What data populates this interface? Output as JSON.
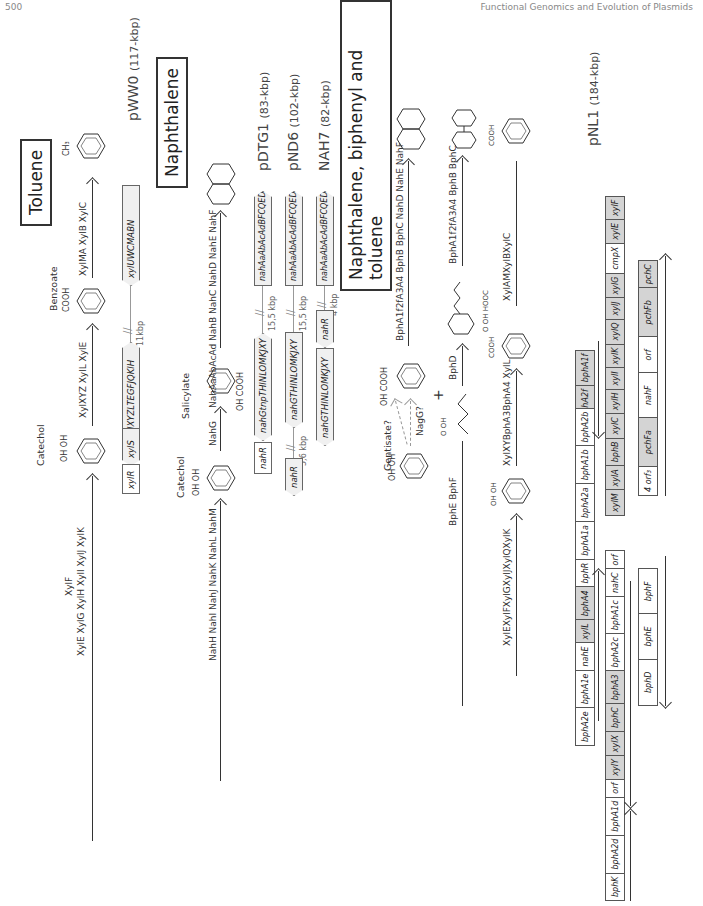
{
  "page_header": {
    "left": "500",
    "right": "Functional Genomics and Evolution of Plasmids"
  },
  "sections": {
    "toluene": "Toluene",
    "naphthalene": "Naphthalene",
    "nbt": "Naphthalene, biphenyl and toluene"
  },
  "toluene": {
    "substrate": "CH₃",
    "step1_enzymes": "XylMA XylB XylC",
    "benzoate_label": "Benzoate",
    "benzoate_group": "COOH",
    "step2_enzymes": "XylXYZ XylL XylE",
    "catechol_label": "Catechol",
    "catechol_groups": [
      "OH",
      "OH"
    ],
    "step3_enzymes_top": "XylF",
    "step3_enzymes": "XylE XylG XylH XylI XylJ XylK",
    "plasmid": {
      "name": "pWW0",
      "size": "(117-kbp)"
    },
    "genes": {
      "upper": "xylUWCMABN",
      "gap": "11kbp",
      "lower": "xylXYZLTEGFJQKIH",
      "s": "xylS",
      "r": "xylR"
    }
  },
  "naphthalene": {
    "step1_enzymes": "NahAaAbAcAd NahB NahC NahD NahE NahF",
    "salicylate_label": "Salicylate",
    "salicylate_groups": [
      "OH",
      "COOH"
    ],
    "step2_enzyme": "NahG",
    "catechol_label": "Catechol",
    "catechol_groups": [
      "OH",
      "OH"
    ],
    "step3_enzymes": "NahH NahI NahJ NahK NahL NahM",
    "plasmids": [
      {
        "name": "pDTG1",
        "size": "(83-kbp)",
        "upper": "nahAaAbAcAdBFCQED",
        "gap": "15,5 kbp",
        "lower": "nahGtnpTHINLOMKJXY",
        "extra": "nahR"
      },
      {
        "name": "pND6",
        "size": "(102-kbp)",
        "upper": "nahAaAbAcAdBFCQED",
        "gap": "15,5 kbp",
        "lower": "nahGTHINLOMKJXY",
        "gap2": "5,6 kbp",
        "extra": "nahR"
      },
      {
        "name": "NAH7",
        "size": "(82-kbp)",
        "upper": "nahAaAbAcAdBFCQED",
        "gap": "4 kbp",
        "mid": "nahR",
        "lower": "nahGTHINLOMKJXY"
      }
    ]
  },
  "nbt": {
    "naph_enzymes": "BphA1f2fA3A4 BphB BphC NahD NahE NahF",
    "salicylate_groups": [
      "OH",
      "COOH"
    ],
    "gentisate": "Gentisate?",
    "nagg": "NagG?",
    "catechol_groups": [
      "OH",
      "OH"
    ],
    "biph_enzymes": "BphA1f2fA3A4 BphB BphC",
    "hopda_groups": [
      "O",
      "OH",
      "HOOC"
    ],
    "bphd": "BphD",
    "plus": "+",
    "pentadienoate_groups": [
      "O",
      "OH"
    ],
    "bphef": "BphE BphF",
    "benz_group": "COOH",
    "xyl_enzymes": "XylAMXylBXylC",
    "benz2_group": "COOH",
    "xyl2_enzymes": "XylXYBphA3BphA4 XylL",
    "cat_groups": [
      "OH",
      "OH"
    ],
    "xyl3_enzymes": "XylEXylFXylGXylJXylQXylK",
    "plasmid": {
      "name": "pNL1",
      "size": "(184-kbp)"
    },
    "row1": [
      {
        "label": "xylB",
        "grey": false
      },
      {
        "label": "bphA2f",
        "grey": true
      },
      {
        "label": "bphA1f",
        "grey": true
      },
      {
        "spacer": true
      },
      {
        "label": "bphA2e",
        "grey": false
      },
      {
        "label": "bphA1e",
        "grey": false
      },
      {
        "label": "nahE",
        "grey": false
      },
      {
        "label": "xylL",
        "grey": true
      },
      {
        "label": "bphA4",
        "grey": true
      },
      {
        "label": "bphR",
        "grey": false
      },
      {
        "label": "bphA1a",
        "grey": false
      },
      {
        "label": "bphA2a",
        "grey": false
      },
      {
        "label": "bphA1b",
        "grey": false
      },
      {
        "label": "bphA2b",
        "grey": false
      }
    ],
    "row2": [
      {
        "label": "xylM",
        "grey": true
      },
      {
        "label": "xylA",
        "grey": true
      },
      {
        "label": "bphB",
        "grey": true
      },
      {
        "label": "xylC",
        "grey": true
      },
      {
        "label": "xylH",
        "grey": true
      },
      {
        "label": "xylI",
        "grey": true
      },
      {
        "label": "xylK",
        "grey": true
      },
      {
        "label": "xylQ",
        "grey": true
      },
      {
        "label": "xylJ",
        "grey": true
      },
      {
        "label": "xylG",
        "grey": true
      },
      {
        "label": "cmpX",
        "grey": false
      },
      {
        "label": "xylE",
        "grey": true
      },
      {
        "label": "xylF",
        "grey": true
      },
      {
        "spacer": true
      },
      {
        "label": "bphK",
        "grey": false
      },
      {
        "label": "bphA2d",
        "grey": false
      },
      {
        "label": "bphA1d",
        "grey": false
      },
      {
        "label": "orf",
        "grey": false
      },
      {
        "label": "xylY",
        "grey": true
      },
      {
        "label": "xylX",
        "grey": true
      },
      {
        "label": "bphC",
        "grey": true
      },
      {
        "label": "bphA3",
        "grey": true
      },
      {
        "label": "bphA2c",
        "grey": false
      },
      {
        "label": "bphA1c",
        "grey": false
      },
      {
        "label": "nahC",
        "grey": false
      },
      {
        "label": "orf",
        "grey": false
      }
    ],
    "row3": [
      {
        "label": "4 orf₃",
        "grey": false
      },
      {
        "label": "pchFa",
        "grey": true
      },
      {
        "label": "nahF",
        "grey": false
      },
      {
        "label": "orf",
        "grey": false
      },
      {
        "label": "pchFb",
        "grey": true
      },
      {
        "label": "pchC",
        "grey": true
      }
    ],
    "row3b": [
      {
        "label": "bphD",
        "grey": false
      },
      {
        "label": "bphE",
        "grey": false
      },
      {
        "label": "bphF",
        "grey": false
      }
    ]
  }
}
